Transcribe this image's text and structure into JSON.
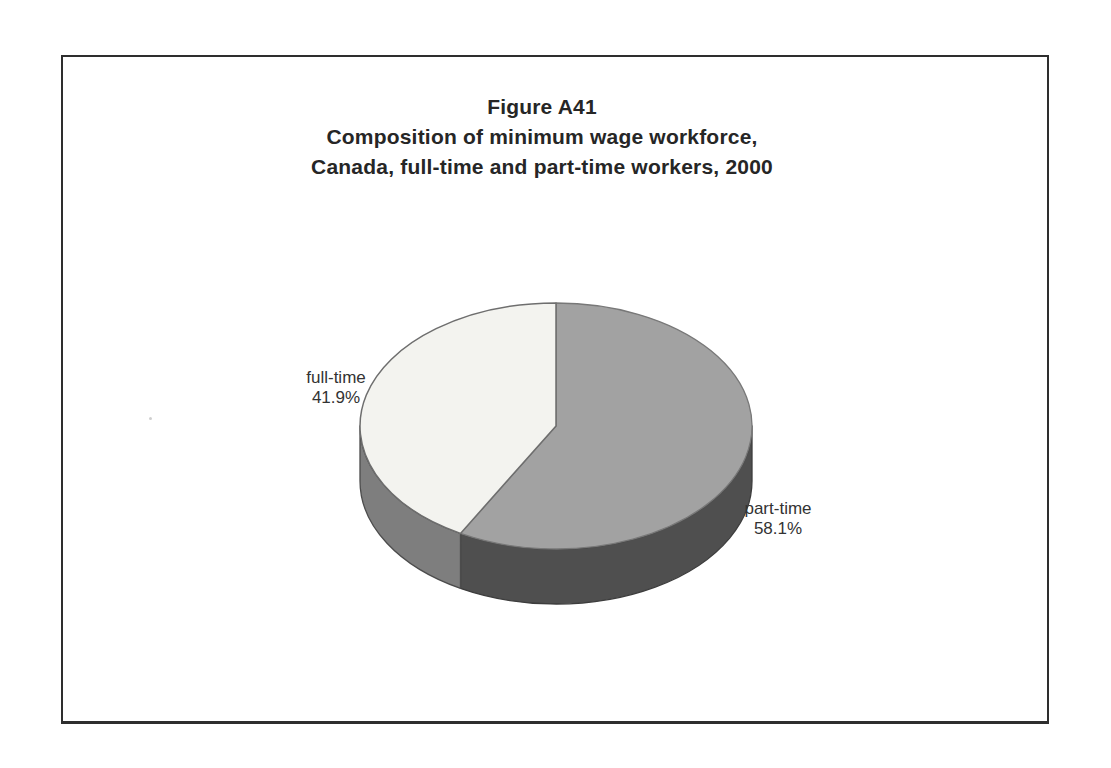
{
  "figure": {
    "title_lines": [
      "Figure A41",
      "Composition of minimum wage workforce,",
      "Canada, full-time and part-time workers, 2000"
    ]
  },
  "chart_data": {
    "type": "pie",
    "style": "3d",
    "title": "Figure A41",
    "subtitle": "Composition of minimum wage workforce, Canada, full-time and part-time workers, 2000",
    "unit": "percent",
    "start_angle": "12 o'clock, clockwise",
    "legend_position": "none",
    "categories": [
      "part-time",
      "full-time"
    ],
    "values": [
      58.1,
      41.9
    ],
    "slices": [
      {
        "label": "part-time",
        "pct": 58.1,
        "pct_label": "58.1%",
        "top_color": "#a2a2a2",
        "side_color": "#4f4f4f",
        "label_position": "right"
      },
      {
        "label": "full-time",
        "pct": 41.9,
        "pct_label": "41.9%",
        "top_color": "#f3f3ef",
        "side_color": "#7e7e7e",
        "label_position": "left"
      }
    ]
  }
}
